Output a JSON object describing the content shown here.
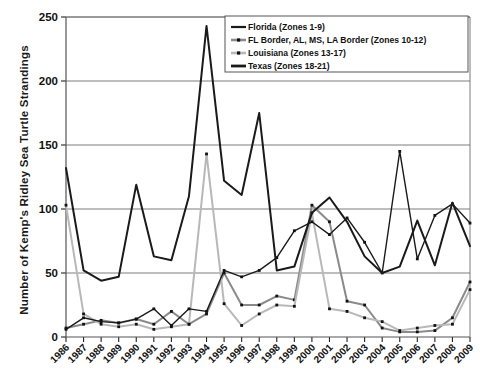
{
  "chart_data": {
    "type": "line",
    "title": "",
    "xlabel": "",
    "ylabel": "Number of Kemp's Ridley Sea Turtle Strandings",
    "ylim": [
      0,
      250
    ],
    "yticks": [
      0,
      50,
      100,
      150,
      200,
      250
    ],
    "grid": true,
    "legend_position": "top-right",
    "markers": true,
    "categories": [
      "1986",
      "1987",
      "1988",
      "1989",
      "1990",
      "1991",
      "1992",
      "1993",
      "1994",
      "1995",
      "1996",
      "1997",
      "1998",
      "1999",
      "2000",
      "2001",
      "2002",
      "2003",
      "2004",
      "2005",
      "2006",
      "2007",
      "2008",
      "2009"
    ],
    "series": [
      {
        "name": "Florida (Zones 1-9)",
        "color": "#1a1a1a",
        "style": "thin-solid",
        "values": [
          6,
          15,
          12,
          11,
          14,
          22,
          9,
          22,
          20,
          52,
          47,
          52,
          62,
          83,
          90,
          80,
          93,
          74,
          50,
          145,
          61,
          95,
          104,
          89
        ]
      },
      {
        "name": "FL Border, AL, MS, LA Border (Zones 10-12)",
        "color": "#8a8a8a",
        "style": "thick-marker",
        "values": [
          7,
          10,
          13,
          11,
          14,
          10,
          20,
          10,
          18,
          50,
          25,
          25,
          32,
          29,
          103,
          90,
          28,
          25,
          7,
          4,
          4,
          5,
          15,
          43
        ]
      },
      {
        "name": "Louisiana (Zones 13-17)",
        "color": "#b8b8b8",
        "style": "thick-marker",
        "values": [
          103,
          18,
          10,
          8,
          10,
          6,
          8,
          10,
          143,
          26,
          9,
          18,
          25,
          24,
          97,
          22,
          20,
          15,
          12,
          5,
          7,
          9,
          10,
          37
        ]
      },
      {
        "name": "Texas (Zones 18-21)",
        "color": "#1a1a1a",
        "style": "thick-solid",
        "values": [
          132,
          52,
          44,
          47,
          119,
          63,
          60,
          110,
          243,
          122,
          111,
          175,
          52,
          55,
          97,
          109,
          90,
          63,
          50,
          55,
          91,
          56,
          105,
          71
        ]
      }
    ]
  },
  "legend": {
    "items": [
      {
        "label": "Florida (Zones 1-9)"
      },
      {
        "label": "FL Border, AL, MS, LA Border (Zones 10-12)"
      },
      {
        "label": "Louisiana (Zones 13-17)"
      },
      {
        "label": "Texas (Zones 18-21)"
      }
    ]
  }
}
